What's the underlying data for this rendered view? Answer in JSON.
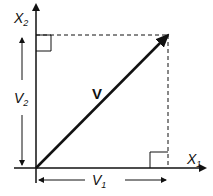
{
  "diagram": {
    "axes": {
      "x_label": "X",
      "x_sub": "1",
      "y_label": "X",
      "y_sub": "2"
    },
    "vector": {
      "label": "V",
      "tail": [
        36,
        168
      ],
      "head": [
        168,
        35
      ]
    },
    "components": {
      "horizontal": {
        "label": "V",
        "sub": "1"
      },
      "vertical": {
        "label": "V",
        "sub": "2"
      }
    },
    "colors": {
      "line": "#111111",
      "background": "#ffffff"
    }
  }
}
